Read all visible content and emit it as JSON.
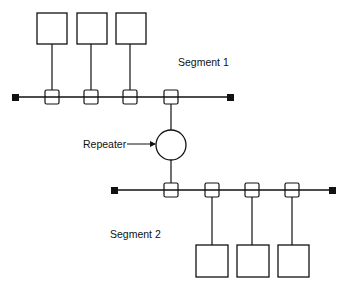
{
  "diagram": {
    "type": "network-topology",
    "colors": {
      "stroke": "#111111",
      "background": "#ffffff"
    },
    "segments": [
      {
        "label": "Segment 1",
        "bus": {
          "x1": 15,
          "x2": 230,
          "y": 97
        },
        "terminators": [
          {
            "x": 15,
            "y": 97
          },
          {
            "x": 230,
            "y": 97
          }
        ],
        "taps": [
          {
            "x": 52
          },
          {
            "x": 91
          },
          {
            "x": 130
          },
          {
            "x": 171
          }
        ],
        "stations": [
          {
            "x": 37,
            "y": 13,
            "w": 30,
            "h": 31,
            "tap": 0
          },
          {
            "x": 77,
            "y": 13,
            "w": 30,
            "h": 31,
            "tap": 1
          },
          {
            "x": 116,
            "y": 13,
            "w": 30,
            "h": 31,
            "tap": 2
          }
        ]
      },
      {
        "label": "Segment 2",
        "bus": {
          "x1": 114,
          "x2": 332,
          "y": 190
        },
        "terminators": [
          {
            "x": 114,
            "y": 190
          },
          {
            "x": 332,
            "y": 190
          }
        ],
        "taps": [
          {
            "x": 171
          },
          {
            "x": 212
          },
          {
            "x": 252
          },
          {
            "x": 292
          }
        ],
        "stations": [
          {
            "x": 196,
            "y": 245,
            "w": 32,
            "h": 32,
            "tap": 1
          },
          {
            "x": 237,
            "y": 245,
            "w": 32,
            "h": 32,
            "tap": 2
          },
          {
            "x": 278,
            "y": 245,
            "w": 31,
            "h": 32,
            "tap": 3
          }
        ]
      }
    ],
    "repeater": {
      "label": "Repeater",
      "cx": 171,
      "cy": 145,
      "r": 15
    }
  }
}
